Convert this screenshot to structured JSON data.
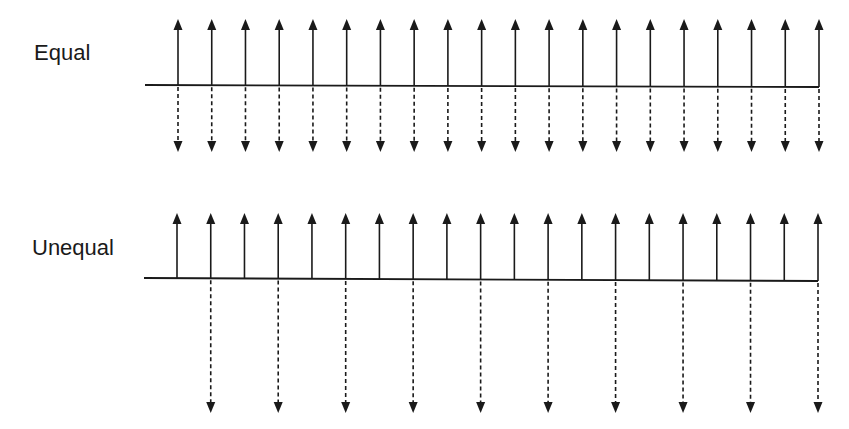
{
  "diagram": {
    "type": "stem-arrow-comparison",
    "colors": {
      "ink": "#1a1a1a",
      "background": "#ffffff"
    },
    "panels": [
      {
        "id": "equal",
        "label": "Equal",
        "arrow_count": 20,
        "up_arrows": [
          1,
          1,
          1,
          1,
          1,
          1,
          1,
          1,
          1,
          1,
          1,
          1,
          1,
          1,
          1,
          1,
          1,
          1,
          1,
          1
        ],
        "down_arrows": [
          1,
          1,
          1,
          1,
          1,
          1,
          1,
          1,
          1,
          1,
          1,
          1,
          1,
          1,
          1,
          1,
          1,
          1,
          1,
          1
        ],
        "up_style": "solid",
        "down_style": "dashed",
        "up_length": "equal",
        "down_length": "equal"
      },
      {
        "id": "unequal",
        "label": "Unequal",
        "arrow_count": 20,
        "up_arrows": [
          1,
          1,
          1,
          1,
          1,
          1,
          1,
          1,
          1,
          1,
          1,
          1,
          1,
          1,
          1,
          1,
          1,
          1,
          1,
          1
        ],
        "down_arrows": [
          0,
          1,
          0,
          1,
          0,
          1,
          0,
          1,
          0,
          1,
          0,
          1,
          0,
          1,
          0,
          1,
          0,
          1,
          0,
          1
        ],
        "up_style": "solid",
        "down_style": "dashed",
        "up_length": "short",
        "down_length": "long (every other position)"
      }
    ]
  },
  "layout": {
    "equal": {
      "x_start": 178,
      "x_end": 819,
      "line_x0": 145,
      "line_x1": 819,
      "baseline_y0": 85,
      "baseline_y1": 87,
      "up_tip_y": 19,
      "down_tip_y": 152
    },
    "unequal": {
      "x_start": 177,
      "x_end": 818,
      "line_x0": 144,
      "line_x1": 818,
      "baseline_y0": 278,
      "baseline_y1": 281,
      "up_tip_y": 213,
      "down_tip_y": 413
    }
  }
}
